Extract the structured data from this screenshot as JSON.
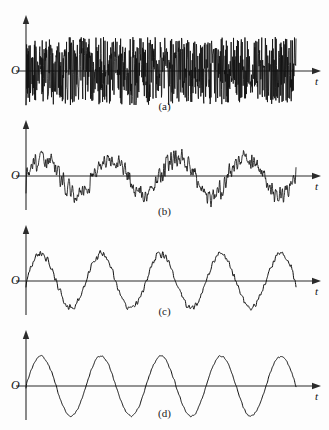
{
  "figure": {
    "title": "",
    "background_color": "#fdfdfd",
    "trace_color": "#101010",
    "axis_color": "#2b2b2b",
    "width": 329,
    "height": 430
  },
  "axis_labels": {
    "origin": "O",
    "time": "t"
  },
  "panels": [
    {
      "id": "a",
      "caption": "(a)",
      "origin": "O",
      "time_axis": "t",
      "description": "pure random noise"
    },
    {
      "id": "b",
      "caption": "(b)",
      "origin": "O",
      "time_axis": "t",
      "description": "sinusoid buried in heavy noise"
    },
    {
      "id": "c",
      "caption": "(c)",
      "origin": "O",
      "time_axis": "t",
      "description": "sinusoid with moderate noise"
    },
    {
      "id": "d",
      "caption": "(d)",
      "origin": "O",
      "time_axis": "t",
      "description": "nearly clean sinusoid"
    }
  ],
  "chart_data": {
    "type": "line",
    "title": "",
    "xlabel": "t",
    "ylabel": "",
    "grid": false,
    "legend": false,
    "n_samples": 900,
    "t_range": [
      0,
      1
    ],
    "panel_layout": "4 stacked subplots labelled (a)-(d)",
    "series": [
      {
        "name": "(a)",
        "panel": "a",
        "model": "noise_only",
        "sine_amplitude": 0,
        "cycles": 0,
        "noise_amplitude": 34,
        "noise_smoothing": 0,
        "snr": 0,
        "ylim": [
          -40,
          40
        ],
        "seed": 11
      },
      {
        "name": "(b)",
        "panel": "b",
        "model": "sine_plus_noise",
        "sine_amplitude": 19,
        "cycles": 4.0,
        "noise_amplitude": 17,
        "noise_smoothing": 2,
        "snr": 1.1,
        "ylim": [
          -40,
          40
        ],
        "seed": 23
      },
      {
        "name": "(c)",
        "panel": "c",
        "model": "sine_plus_noise",
        "sine_amplitude": 27,
        "cycles": 4.5,
        "noise_amplitude": 6,
        "noise_smoothing": 3,
        "snr": 4.5,
        "ylim": [
          -40,
          40
        ],
        "seed": 37
      },
      {
        "name": "(d)",
        "panel": "d",
        "model": "sine_plus_noise",
        "sine_amplitude": 30,
        "cycles": 4.5,
        "noise_amplitude": 2,
        "noise_smoothing": 4,
        "snr": 15,
        "ylim": [
          -40,
          40
        ],
        "seed": 53
      }
    ]
  }
}
